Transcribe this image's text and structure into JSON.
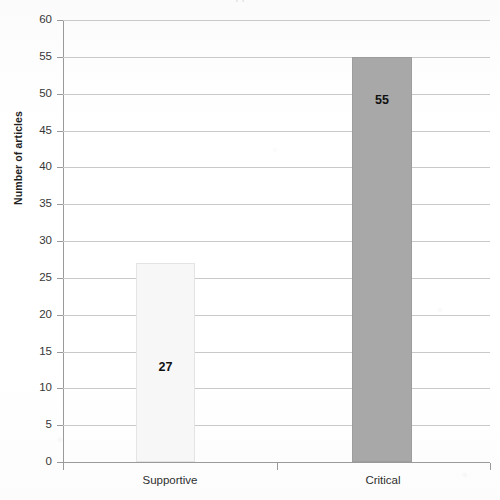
{
  "chart_data": {
    "type": "bar",
    "title": "",
    "xlabel": "",
    "ylabel": "Number of articles",
    "categories": [
      "Supportive",
      "Critical"
    ],
    "values": [
      27,
      55
    ],
    "value_labels": [
      "27",
      "55"
    ],
    "ylim": [
      0,
      60
    ],
    "ytick_step": 5,
    "yticks": [
      60,
      55,
      50,
      45,
      40,
      35,
      30,
      25,
      20,
      15,
      10,
      5,
      0
    ],
    "ytick_labels": [
      "60",
      "55",
      "50",
      "45",
      "40",
      "35",
      "30",
      "25",
      "20",
      "15",
      "10",
      "5",
      "0"
    ],
    "grid": true,
    "grid_axis": "y",
    "legend": false,
    "series": [
      {
        "name": "Number of articles",
        "values": [
          27,
          55
        ],
        "bar_colors": [
          "#f7f7f7",
          "#a8a8a8"
        ]
      }
    ],
    "bars": [
      {
        "category": "Supportive",
        "value": 27,
        "label": "27",
        "color": "#f7f7f7",
        "border_color": "#e4e4e4"
      },
      {
        "category": "Critical",
        "value": 55,
        "label": "55",
        "color": "#a8a8a8",
        "border_color": "#9d9d9d"
      }
    ]
  },
  "figure": {
    "title_fragment": "cropped title",
    "axis_color": "#9a9a9a",
    "grid_color": "#c9c9c9",
    "background": "#fdfdfd",
    "tick_label_color": "#373737"
  }
}
